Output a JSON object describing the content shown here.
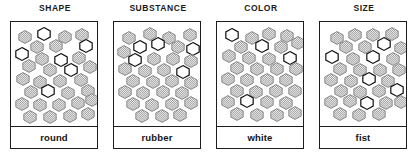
{
  "figure": {
    "background_color": "#ffffff",
    "outline_color": "#1d1d1d",
    "filled_color": "#9a9a9a",
    "open_color": "#ffffff"
  },
  "panels": [
    {
      "id": "shape",
      "header": "SHAPE",
      "caption": "round",
      "hexagons": [
        {
          "x": 7,
          "y": 8,
          "fill": "filled"
        },
        {
          "x": 26,
          "y": 5,
          "fill": "open"
        },
        {
          "x": 47,
          "y": 8,
          "fill": "filled"
        },
        {
          "x": 64,
          "y": 6,
          "fill": "filled"
        },
        {
          "x": 19,
          "y": 18,
          "fill": "filled"
        },
        {
          "x": 38,
          "y": 17,
          "fill": "filled"
        },
        {
          "x": 68,
          "y": 17,
          "fill": "open"
        },
        {
          "x": 4,
          "y": 25,
          "fill": "open"
        },
        {
          "x": 24,
          "y": 30,
          "fill": "filled"
        },
        {
          "x": 43,
          "y": 31,
          "fill": "open"
        },
        {
          "x": 61,
          "y": 29,
          "fill": "filled"
        },
        {
          "x": 11,
          "y": 37,
          "fill": "filled"
        },
        {
          "x": 32,
          "y": 41,
          "fill": "filled"
        },
        {
          "x": 53,
          "y": 41,
          "fill": "open"
        },
        {
          "x": 72,
          "y": 38,
          "fill": "filled"
        },
        {
          "x": 5,
          "y": 50,
          "fill": "filled"
        },
        {
          "x": 22,
          "y": 53,
          "fill": "filled"
        },
        {
          "x": 42,
          "y": 52,
          "fill": "filled"
        },
        {
          "x": 63,
          "y": 51,
          "fill": "filled"
        },
        {
          "x": 13,
          "y": 63,
          "fill": "filled"
        },
        {
          "x": 30,
          "y": 62,
          "fill": "open"
        },
        {
          "x": 50,
          "y": 64,
          "fill": "filled"
        },
        {
          "x": 70,
          "y": 62,
          "fill": "filled"
        },
        {
          "x": 4,
          "y": 75,
          "fill": "filled"
        },
        {
          "x": 22,
          "y": 76,
          "fill": "filled"
        },
        {
          "x": 41,
          "y": 76,
          "fill": "filled"
        },
        {
          "x": 60,
          "y": 74,
          "fill": "filled"
        },
        {
          "x": 74,
          "y": 71,
          "fill": "filled"
        },
        {
          "x": 12,
          "y": 88,
          "fill": "filled"
        },
        {
          "x": 32,
          "y": 88,
          "fill": "filled"
        },
        {
          "x": 52,
          "y": 87,
          "fill": "filled"
        },
        {
          "x": 70,
          "y": 85,
          "fill": "filled"
        }
      ]
    },
    {
      "id": "substance",
      "header": "SUBSTANCE",
      "caption": "rubber",
      "hexagons": [
        {
          "x": 8,
          "y": 9,
          "fill": "filled"
        },
        {
          "x": 29,
          "y": 5,
          "fill": "filled"
        },
        {
          "x": 48,
          "y": 9,
          "fill": "filled"
        },
        {
          "x": 69,
          "y": 6,
          "fill": "filled"
        },
        {
          "x": 19,
          "y": 18,
          "fill": "open"
        },
        {
          "x": 37,
          "y": 15,
          "fill": "open"
        },
        {
          "x": 57,
          "y": 18,
          "fill": "filled"
        },
        {
          "x": 3,
          "y": 23,
          "fill": "filled"
        },
        {
          "x": 72,
          "y": 20,
          "fill": "open"
        },
        {
          "x": 14,
          "y": 31,
          "fill": "open"
        },
        {
          "x": 33,
          "y": 30,
          "fill": "filled"
        },
        {
          "x": 52,
          "y": 30,
          "fill": "filled"
        },
        {
          "x": 70,
          "y": 32,
          "fill": "filled"
        },
        {
          "x": 4,
          "y": 40,
          "fill": "filled"
        },
        {
          "x": 24,
          "y": 42,
          "fill": "filled"
        },
        {
          "x": 43,
          "y": 41,
          "fill": "filled"
        },
        {
          "x": 62,
          "y": 43,
          "fill": "open"
        },
        {
          "x": 12,
          "y": 52,
          "fill": "filled"
        },
        {
          "x": 32,
          "y": 53,
          "fill": "filled"
        },
        {
          "x": 51,
          "y": 52,
          "fill": "filled"
        },
        {
          "x": 70,
          "y": 54,
          "fill": "filled"
        },
        {
          "x": 4,
          "y": 63,
          "fill": "filled"
        },
        {
          "x": 22,
          "y": 64,
          "fill": "filled"
        },
        {
          "x": 42,
          "y": 63,
          "fill": "filled"
        },
        {
          "x": 61,
          "y": 64,
          "fill": "filled"
        },
        {
          "x": 12,
          "y": 75,
          "fill": "filled"
        },
        {
          "x": 31,
          "y": 76,
          "fill": "filled"
        },
        {
          "x": 51,
          "y": 75,
          "fill": "filled"
        },
        {
          "x": 70,
          "y": 74,
          "fill": "filled"
        },
        {
          "x": 21,
          "y": 87,
          "fill": "filled"
        },
        {
          "x": 41,
          "y": 87,
          "fill": "filled"
        },
        {
          "x": 59,
          "y": 86,
          "fill": "filled"
        }
      ]
    },
    {
      "id": "color",
      "header": "COLOR",
      "caption": "white",
      "hexagons": [
        {
          "x": 8,
          "y": 6,
          "fill": "open"
        },
        {
          "x": 28,
          "y": 9,
          "fill": "filled"
        },
        {
          "x": 45,
          "y": 5,
          "fill": "filled"
        },
        {
          "x": 63,
          "y": 7,
          "fill": "filled"
        },
        {
          "x": 17,
          "y": 18,
          "fill": "filled"
        },
        {
          "x": 38,
          "y": 17,
          "fill": "open"
        },
        {
          "x": 57,
          "y": 18,
          "fill": "filled"
        },
        {
          "x": 74,
          "y": 14,
          "fill": "filled"
        },
        {
          "x": 5,
          "y": 27,
          "fill": "filled"
        },
        {
          "x": 25,
          "y": 29,
          "fill": "filled"
        },
        {
          "x": 45,
          "y": 30,
          "fill": "filled"
        },
        {
          "x": 66,
          "y": 29,
          "fill": "open"
        },
        {
          "x": 13,
          "y": 39,
          "fill": "filled"
        },
        {
          "x": 33,
          "y": 40,
          "fill": "filled"
        },
        {
          "x": 53,
          "y": 40,
          "fill": "filled"
        },
        {
          "x": 72,
          "y": 40,
          "fill": "filled"
        },
        {
          "x": 4,
          "y": 50,
          "fill": "filled"
        },
        {
          "x": 23,
          "y": 51,
          "fill": "filled"
        },
        {
          "x": 43,
          "y": 51,
          "fill": "filled"
        },
        {
          "x": 62,
          "y": 51,
          "fill": "filled"
        },
        {
          "x": 13,
          "y": 62,
          "fill": "filled"
        },
        {
          "x": 32,
          "y": 63,
          "fill": "filled"
        },
        {
          "x": 52,
          "y": 62,
          "fill": "filled"
        },
        {
          "x": 71,
          "y": 62,
          "fill": "filled"
        },
        {
          "x": 4,
          "y": 73,
          "fill": "filled"
        },
        {
          "x": 23,
          "y": 72,
          "fill": "open"
        },
        {
          "x": 43,
          "y": 73,
          "fill": "filled"
        },
        {
          "x": 62,
          "y": 74,
          "fill": "filled"
        },
        {
          "x": 13,
          "y": 85,
          "fill": "filled"
        },
        {
          "x": 33,
          "y": 86,
          "fill": "filled"
        },
        {
          "x": 53,
          "y": 86,
          "fill": "filled"
        },
        {
          "x": 71,
          "y": 84,
          "fill": "filled"
        }
      ]
    },
    {
      "id": "size",
      "header": "SIZE",
      "caption": "fist",
      "hexagons": [
        {
          "x": 10,
          "y": 9,
          "fill": "filled"
        },
        {
          "x": 28,
          "y": 6,
          "fill": "filled"
        },
        {
          "x": 46,
          "y": 6,
          "fill": "filled"
        },
        {
          "x": 65,
          "y": 5,
          "fill": "filled"
        },
        {
          "x": 19,
          "y": 18,
          "fill": "filled"
        },
        {
          "x": 38,
          "y": 18,
          "fill": "filled"
        },
        {
          "x": 57,
          "y": 15,
          "fill": "open"
        },
        {
          "x": 74,
          "y": 19,
          "fill": "filled"
        },
        {
          "x": 5,
          "y": 28,
          "fill": "open"
        },
        {
          "x": 26,
          "y": 30,
          "fill": "filled"
        },
        {
          "x": 46,
          "y": 28,
          "fill": "open"
        },
        {
          "x": 66,
          "y": 30,
          "fill": "filled"
        },
        {
          "x": 13,
          "y": 40,
          "fill": "filled"
        },
        {
          "x": 33,
          "y": 41,
          "fill": "filled"
        },
        {
          "x": 53,
          "y": 41,
          "fill": "filled"
        },
        {
          "x": 72,
          "y": 41,
          "fill": "filled"
        },
        {
          "x": 4,
          "y": 51,
          "fill": "filled"
        },
        {
          "x": 24,
          "y": 52,
          "fill": "filled"
        },
        {
          "x": 42,
          "y": 50,
          "fill": "open"
        },
        {
          "x": 61,
          "y": 52,
          "fill": "filled"
        },
        {
          "x": 14,
          "y": 62,
          "fill": "filled"
        },
        {
          "x": 33,
          "y": 63,
          "fill": "filled"
        },
        {
          "x": 52,
          "y": 62,
          "fill": "filled"
        },
        {
          "x": 70,
          "y": 61,
          "fill": "open"
        },
        {
          "x": 4,
          "y": 73,
          "fill": "filled"
        },
        {
          "x": 23,
          "y": 72,
          "fill": "filled"
        },
        {
          "x": 40,
          "y": 74,
          "fill": "open"
        },
        {
          "x": 59,
          "y": 74,
          "fill": "filled"
        },
        {
          "x": 74,
          "y": 73,
          "fill": "filled"
        },
        {
          "x": 13,
          "y": 85,
          "fill": "filled"
        },
        {
          "x": 32,
          "y": 86,
          "fill": "filled"
        },
        {
          "x": 52,
          "y": 85,
          "fill": "filled"
        }
      ]
    }
  ]
}
